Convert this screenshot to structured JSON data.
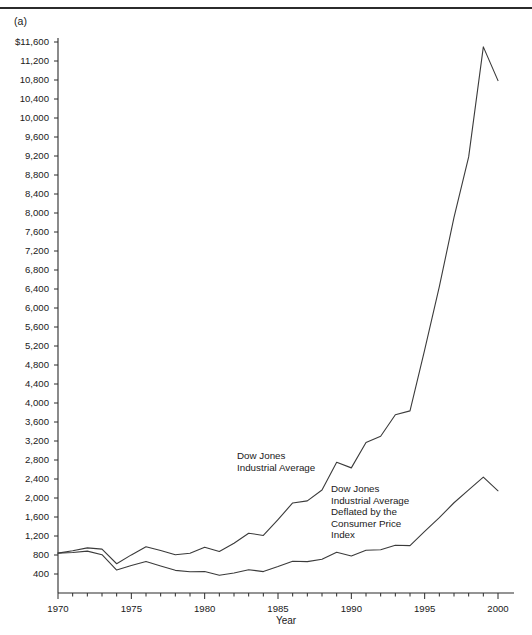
{
  "figure": {
    "panel_label": "(a)"
  },
  "chart_data": {
    "type": "line",
    "title": "",
    "xlabel": "Year",
    "ylabel": "",
    "xlim": [
      1970,
      2000
    ],
    "ylim": [
      0,
      11600
    ],
    "grid": false,
    "legend_position": "inline-annotations",
    "x_ticks": [
      1970,
      1975,
      1980,
      1985,
      1990,
      1995,
      2000
    ],
    "x_tick_labels": [
      "1970",
      "1975",
      "1980",
      "1985",
      "1990",
      "1995",
      "2000"
    ],
    "x_minor_tick_step": 1,
    "y_ticks": [
      400,
      800,
      1200,
      1600,
      2000,
      2400,
      2800,
      3200,
      3600,
      4000,
      4400,
      4800,
      5200,
      5600,
      6000,
      6400,
      6800,
      7200,
      7600,
      8000,
      8400,
      8800,
      9200,
      9600,
      10000,
      10400,
      10800,
      11200,
      11600
    ],
    "y_tick_labels": [
      "400",
      "800",
      "1,200",
      "1,600",
      "2,000",
      "2,400",
      "2,800",
      "3,200",
      "3,600",
      "4,000",
      "4,400",
      "4,800",
      "5,200",
      "5,600",
      "6,000",
      "6,400",
      "6,800",
      "7,200",
      "7,600",
      "8,000",
      "8,400",
      "8,800",
      "9,200",
      "9,600",
      "10,000",
      "10,400",
      "10,800",
      "11,200",
      "$11,600"
    ],
    "x": [
      1970,
      1971,
      1972,
      1973,
      1974,
      1975,
      1976,
      1977,
      1978,
      1979,
      1980,
      1981,
      1982,
      1983,
      1984,
      1985,
      1986,
      1987,
      1988,
      1989,
      1990,
      1991,
      1992,
      1993,
      1994,
      1995,
      1996,
      1997,
      1998,
      1999,
      2000
    ],
    "series": [
      {
        "name": "Dow Jones Industrial Average",
        "values": [
          840,
          890,
          950,
          924,
          616,
          802,
          974,
          894,
          805,
          838,
          964,
          875,
          1047,
          1259,
          1212,
          1547,
          1896,
          1939,
          2169,
          2753,
          2634,
          3169,
          3301,
          3754,
          3834,
          5117,
          6448,
          7908,
          9181,
          11497,
          10787
        ]
      },
      {
        "name": "Dow Jones Industrial Average Deflated by the Consumer Price Index",
        "values": [
          840,
          852,
          881,
          806,
          484,
          577,
          662,
          570,
          477,
          446,
          452,
          372,
          420,
          489,
          451,
          556,
          669,
          660,
          709,
          859,
          780,
          900,
          911,
          1005,
          998,
          1296,
          1586,
          1900,
          2171,
          2438,
          2152
        ]
      }
    ],
    "annotations": [
      {
        "name": "nominal-series-label",
        "lines": [
          "Dow Jones",
          "Industrial Average"
        ],
        "x_px": 237,
        "y_px": 459
      },
      {
        "name": "deflated-series-label",
        "lines": [
          "Dow Jones",
          "Industrial Average",
          "Deflated by the",
          "Consumer Price",
          "Index"
        ],
        "x_px": 331,
        "y_px": 492
      }
    ]
  }
}
